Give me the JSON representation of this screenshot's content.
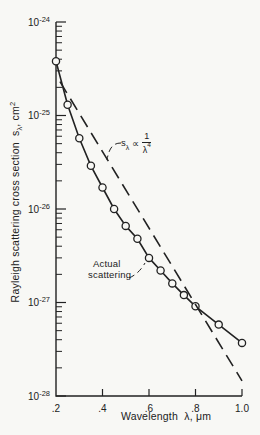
{
  "page": {
    "background": "#f8f8f5",
    "ink": "#222222"
  },
  "chart_data": {
    "type": "line",
    "title": "",
    "grid": false,
    "legend_position": "none",
    "x_axis": {
      "label": "Wavelength  λ, μm",
      "scale": "linear",
      "min": 0.2,
      "max": 1.0,
      "ticks": [
        0.2,
        0.4,
        0.6,
        0.8,
        1.0
      ],
      "tick_labels": [
        ".2",
        ".4",
        ".6",
        ".8",
        "1.0"
      ]
    },
    "y_axis": {
      "scale": "log",
      "min": 1e-28,
      "max": 1e-24,
      "mantissa_base": "10",
      "tick_exponents": [
        -24,
        -25,
        -26,
        -27,
        -28
      ],
      "title": {
        "prefix": "Rayleigh scattering cross section  ",
        "symbol": "s",
        "symbol_sub": "λ",
        "unit": ", cm",
        "unit_sup": "2"
      }
    },
    "series": [
      {
        "name": "Actual scattering",
        "line_style": "solid",
        "marker": "open-circle",
        "points": [
          [
            0.2,
            3.8e-25
          ],
          [
            0.25,
            1.3e-25
          ],
          [
            0.3,
            5.7e-26
          ],
          [
            0.35,
            2.9e-26
          ],
          [
            0.4,
            1.7e-26
          ],
          [
            0.45,
            1e-26
          ],
          [
            0.5,
            6.6e-27
          ],
          [
            0.55,
            4.8e-27
          ],
          [
            0.6,
            3e-27
          ],
          [
            0.65,
            2.2e-27
          ],
          [
            0.7,
            1.6e-27
          ],
          [
            0.75,
            1.2e-27
          ],
          [
            0.8,
            9.1e-28
          ],
          [
            0.9,
            5.8e-28
          ],
          [
            1.0,
            3.7e-28
          ]
        ]
      },
      {
        "name": "Rayleigh 1/λ⁴ law",
        "line_style": "dashed",
        "marker": "none",
        "points": [
          [
            0.217,
            2.3e-25
          ],
          [
            1.0,
            1.45e-28
          ]
        ]
      }
    ],
    "annotations": [
      {
        "text": "Actual scattering",
        "points_to": "solid series"
      },
      {
        "text": "sλ ∝ 1/λ⁴",
        "points_to": "dashed series"
      }
    ]
  },
  "labels": {
    "actual": {
      "line1": "Actual",
      "line2": "scattering"
    },
    "rayleigh": {
      "symbol": "s",
      "symbol_sub": "λ",
      "propto": "∝",
      "frac_num": "1",
      "frac_den_base": "λ",
      "frac_den_exp": "4"
    }
  }
}
